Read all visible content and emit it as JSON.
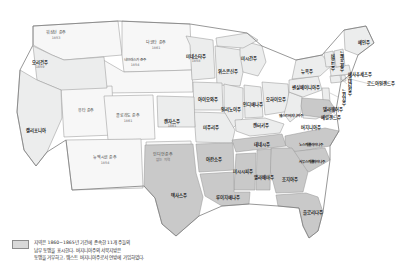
{
  "meta": {
    "period": "1860~1865"
  },
  "colors": {
    "union": "#eceded",
    "confederate": "#c9c9c9",
    "territory": "#f7f7f7",
    "border": "#9a9a9a",
    "outline": "#7d7d7d",
    "background": "#ffffff",
    "label": "#1a1a1a",
    "year": "#6b6b6b",
    "legend_swatch": "#d9d9d9"
  },
  "legend": {
    "swatch_name": "confederate-swatch",
    "lines": [
      "지역은 1860~1865년 기간에 존속한 11개 주들의",
      "남부 동맹을 표시한다. 버지니아주의 서북지방은",
      "동맹을 거부하고, 웨스트 버지니아주로서 연방에 가입하였다."
    ]
  },
  "regions": [
    {
      "key": "washington-territory",
      "label": "워싱턴 준주",
      "year": "1853",
      "type": "territory",
      "x": 56,
      "y": 36,
      "orient": "h"
    },
    {
      "key": "oregon",
      "label": "오리건주",
      "year": "1859",
      "type": "union",
      "x": 40,
      "y": 65,
      "orient": "h"
    },
    {
      "key": "dakota-territory",
      "label": "다코타 준주",
      "year": "1861",
      "type": "territory",
      "x": 156,
      "y": 46,
      "orient": "h"
    },
    {
      "key": "nebraska-territory",
      "label": "네브래스카 준주",
      "year": "1854",
      "type": "territory",
      "x": 135,
      "y": 62,
      "orient": "h"
    },
    {
      "key": "utah-territory",
      "label": "유타 준주",
      "year": "",
      "type": "territory",
      "x": 86,
      "y": 111,
      "orient": "h"
    },
    {
      "key": "california",
      "label": "캘리포니아",
      "year": "",
      "type": "union",
      "x": 36,
      "y": 131,
      "orient": "h"
    },
    {
      "key": "colorado-territory",
      "label": "콜로라도 준주",
      "year": "1861",
      "type": "territory",
      "x": 128,
      "y": 119,
      "orient": "h"
    },
    {
      "key": "kansas",
      "label": "캔자스주",
      "year": "1861",
      "type": "union",
      "x": 172,
      "y": 124,
      "orient": "h"
    },
    {
      "key": "new-mexico-territory",
      "label": "뉴멕시코 준주",
      "year": "1854",
      "type": "territory",
      "x": 105,
      "y": 161,
      "orient": "h"
    },
    {
      "key": "indian-territory",
      "label": "인디언준주",
      "year": "없는 지역",
      "type": "territory",
      "x": 163,
      "y": 158,
      "orient": "h"
    },
    {
      "key": "minnesota",
      "label": "미네소타주",
      "year": "1858",
      "type": "union",
      "x": 196,
      "y": 59,
      "orient": "h"
    },
    {
      "key": "wisconsin",
      "label": "위스콘신주",
      "year": "",
      "type": "union",
      "x": 228,
      "y": 72,
      "orient": "h"
    },
    {
      "key": "iowa",
      "label": "아이오와주",
      "year": "",
      "type": "union",
      "x": 208,
      "y": 100,
      "orient": "h"
    },
    {
      "key": "michigan",
      "label": "미시간주",
      "year": "",
      "type": "union",
      "x": 249,
      "y": 59,
      "orient": "h"
    },
    {
      "key": "illinois",
      "label": "일리노이주",
      "year": "",
      "type": "union",
      "x": 231,
      "y": 110,
      "orient": "h"
    },
    {
      "key": "indiana",
      "label": "인디애나주",
      "year": "",
      "type": "union",
      "x": 253,
      "y": 105,
      "orient": "h"
    },
    {
      "key": "ohio",
      "label": "오하이오주",
      "year": "",
      "type": "union",
      "x": 276,
      "y": 100,
      "orient": "h"
    },
    {
      "key": "missouri",
      "label": "미주리주",
      "year": "",
      "type": "union",
      "x": 211,
      "y": 128,
      "orient": "h"
    },
    {
      "key": "kentucky",
      "label": "켄터키주",
      "year": "",
      "type": "union",
      "x": 261,
      "y": 126,
      "orient": "h"
    },
    {
      "key": "west-virginia",
      "label": "웨스트버지니아주",
      "year": "",
      "type": "union",
      "x": 291,
      "y": 116,
      "orient": "h"
    },
    {
      "key": "virginia",
      "label": "버지니아주",
      "year": "",
      "type": "confederate",
      "x": 311,
      "y": 128,
      "orient": "h"
    },
    {
      "key": "maryland",
      "label": "메릴랜드주",
      "year": "",
      "type": "union",
      "x": 331,
      "y": 118,
      "orient": "h"
    },
    {
      "key": "delaware",
      "label": "델라웨어주",
      "year": "",
      "type": "union",
      "x": 333,
      "y": 110,
      "orient": "h"
    },
    {
      "key": "pennsylvania",
      "label": "펜실베이니아주",
      "year": "",
      "type": "union",
      "x": 306,
      "y": 88,
      "orient": "h"
    },
    {
      "key": "new-york",
      "label": "뉴욕주",
      "year": "",
      "type": "union",
      "x": 307,
      "y": 72,
      "orient": "h"
    },
    {
      "key": "new-jersey",
      "label": "뉴저지주",
      "year": "",
      "type": "union",
      "x": 343,
      "y": 97,
      "orient": "v"
    },
    {
      "key": "connecticut",
      "label": "코네티컷주",
      "year": "",
      "type": "union",
      "x": 349,
      "y": 85,
      "orient": "v"
    },
    {
      "key": "rhode-island",
      "label": "로드아일랜드주",
      "year": "",
      "type": "union",
      "x": 381,
      "y": 84,
      "orient": "h"
    },
    {
      "key": "massachusetts",
      "label": "매사추세츠주",
      "year": "",
      "type": "union",
      "x": 360,
      "y": 75,
      "orient": "h"
    },
    {
      "key": "vermont",
      "label": "버몬트주",
      "year": "",
      "type": "union",
      "x": 332,
      "y": 62,
      "orient": "v"
    },
    {
      "key": "new-hampshire",
      "label": "뉴햄프셔주",
      "year": "",
      "type": "union",
      "x": 341,
      "y": 61,
      "orient": "v"
    },
    {
      "key": "maine",
      "label": "메인주",
      "year": "",
      "type": "union",
      "x": 364,
      "y": 43,
      "orient": "h"
    },
    {
      "key": "north-carolina",
      "label": "노스캐롤라이나주",
      "year": "",
      "type": "confederate",
      "x": 311,
      "y": 145,
      "orient": "h"
    },
    {
      "key": "tennessee",
      "label": "테네시주",
      "year": "",
      "type": "confederate",
      "x": 262,
      "y": 145,
      "orient": "h"
    },
    {
      "key": "arkansas",
      "label": "아칸소주",
      "year": "",
      "type": "confederate",
      "x": 214,
      "y": 160,
      "orient": "h"
    },
    {
      "key": "mississippi",
      "label": "미시시피주",
      "year": "",
      "type": "confederate",
      "x": 243,
      "y": 172,
      "orient": "h"
    },
    {
      "key": "alabama",
      "label": "앨라배마주",
      "year": "",
      "type": "confederate",
      "x": 264,
      "y": 178,
      "orient": "h"
    },
    {
      "key": "south-carolina",
      "label": "사우스캐롤라이나주",
      "year": "",
      "type": "confederate",
      "x": 312,
      "y": 162,
      "orient": "h"
    },
    {
      "key": "georgia",
      "label": "조지아주",
      "year": "",
      "type": "confederate",
      "x": 290,
      "y": 180,
      "orient": "h"
    },
    {
      "key": "texas",
      "label": "텍사스주",
      "year": "",
      "type": "confederate",
      "x": 179,
      "y": 196,
      "orient": "h"
    },
    {
      "key": "louisiana",
      "label": "루이지애나주",
      "year": "",
      "type": "confederate",
      "x": 228,
      "y": 198,
      "orient": "h"
    },
    {
      "key": "florida",
      "label": "플로리다주",
      "year": "",
      "type": "confederate",
      "x": 313,
      "y": 213,
      "orient": "h"
    }
  ]
}
